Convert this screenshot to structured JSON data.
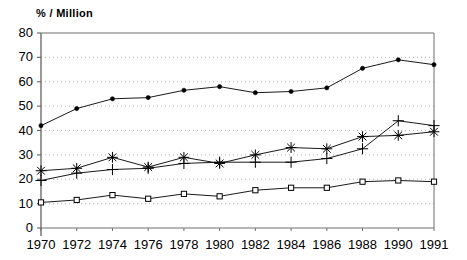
{
  "chart_data": {
    "type": "line",
    "title": "",
    "subtitle": "",
    "xlabel": "",
    "ylabel": "% / Million",
    "categories": [
      "1970",
      "1972",
      "1974",
      "1976",
      "1978",
      "1980",
      "1982",
      "1984",
      "1986",
      "1988",
      "1990",
      "1991"
    ],
    "x": [
      1970,
      1972,
      1974,
      1976,
      1978,
      1980,
      1982,
      1984,
      1986,
      1988,
      1990,
      1991
    ],
    "ylim": [
      0,
      80
    ],
    "yticks": [
      0,
      10,
      20,
      30,
      40,
      50,
      60,
      70,
      80
    ],
    "xticks": [
      "1970",
      "1972",
      "1974",
      "1976",
      "1978",
      "1980",
      "1982",
      "1984",
      "1986",
      "1988",
      "1990",
      "1991"
    ],
    "grid": true,
    "grid_style": "dotted-horizontal",
    "legend": "none",
    "legend_position": "none",
    "series": [
      {
        "name": "series-filled-circle",
        "marker": "filled-circle",
        "color": "#000000",
        "values": [
          42,
          49,
          53,
          53.5,
          56.5,
          58,
          55.5,
          56,
          57.5,
          65.5,
          69,
          67
        ]
      },
      {
        "name": "series-asterisk",
        "marker": "asterisk",
        "color": "#000000",
        "values": [
          23.5,
          24.5,
          29,
          25,
          29,
          26.5,
          30,
          33,
          32.5,
          37.5,
          38,
          39.5
        ]
      },
      {
        "name": "series-plus",
        "marker": "plus",
        "color": "#000000",
        "values": [
          19.5,
          22.5,
          24,
          24.5,
          26.5,
          27,
          27,
          27,
          28.5,
          32.5,
          44,
          42
        ]
      },
      {
        "name": "series-open-square",
        "marker": "open-square",
        "color": "#000000",
        "values": [
          10.5,
          11.5,
          13.5,
          12,
          14,
          13,
          15.5,
          16.5,
          16.5,
          19,
          19.5,
          19
        ]
      }
    ]
  },
  "axis": {
    "y_title": "% / Million"
  }
}
